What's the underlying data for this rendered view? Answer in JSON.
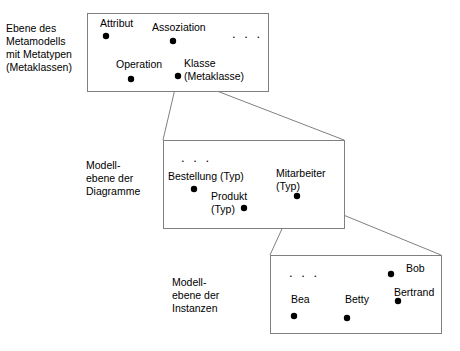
{
  "diagram": {
    "stroke_color": "#808080",
    "dot_color": "#000000",
    "text_color": "#000000",
    "background": "#ffffff",
    "levels": [
      {
        "id": "metamodel",
        "side_label_lines": [
          "Ebene des",
          "Metamodells",
          "mit Metatypen",
          "(Metaklassen)"
        ],
        "box": {
          "x": 87,
          "y": 13,
          "w": 181,
          "h": 78
        },
        "side_label_pos": {
          "x": 6,
          "y": 32
        },
        "ellipsis": {
          "text": ". . .",
          "x": 232,
          "y": 38
        },
        "nodes": [
          {
            "name": "Attribut",
            "lines": [
              "Attribut"
            ],
            "label_x": 100,
            "label_y": 27,
            "dot_x": 106,
            "dot_y": 36
          },
          {
            "name": "Assoziation",
            "lines": [
              "Assoziation"
            ],
            "label_x": 152,
            "label_y": 31,
            "dot_x": 173,
            "dot_y": 41
          },
          {
            "name": "Operation",
            "lines": [
              "Operation"
            ],
            "label_x": 116,
            "label_y": 68,
            "dot_x": 131,
            "dot_y": 79
          },
          {
            "name": "Klasse (Metaklasse)",
            "lines": [
              "Klasse",
              "(Metaklasse)"
            ],
            "label_x": 184,
            "label_y": 67,
            "dot_x": 178,
            "dot_y": 76
          }
        ]
      },
      {
        "id": "diagram-model",
        "side_label_lines": [
          "Modell-",
          "ebene der",
          "Diagramme"
        ],
        "box": {
          "x": 163,
          "y": 140,
          "w": 181,
          "h": 88
        },
        "side_label_pos": {
          "x": 86,
          "y": 169
        },
        "ellipsis": {
          "text": ". . .",
          "x": 181,
          "y": 162
        },
        "nodes": [
          {
            "name": "Bestellung (Typ)",
            "lines": [
              "Bestellung (Typ)"
            ],
            "label_x": 168,
            "label_y": 180,
            "dot_x": 194,
            "dot_y": 189
          },
          {
            "name": "Produkt (Typ)",
            "lines": [
              "Produkt",
              "(Typ)"
            ],
            "label_x": 211,
            "label_y": 200,
            "dot_x": 244,
            "dot_y": 208
          },
          {
            "name": "Mitarbeiter (Typ)",
            "lines": [
              "Mitarbeiter",
              "(Typ)"
            ],
            "label_x": 276,
            "label_y": 177,
            "dot_x": 297,
            "dot_y": 196
          }
        ]
      },
      {
        "id": "instance-model",
        "side_label_lines": [
          "Modell-",
          "ebene der",
          "Instanzen"
        ],
        "box": {
          "x": 270,
          "y": 255,
          "w": 171,
          "h": 78
        },
        "side_label_pos": {
          "x": 172,
          "y": 286
        },
        "ellipsis": {
          "text": ". . .",
          "x": 289,
          "y": 277
        },
        "nodes": [
          {
            "name": "Bob",
            "lines": [
              "Bob"
            ],
            "label_x": 406,
            "label_y": 272,
            "dot_x": 391,
            "dot_y": 274
          },
          {
            "name": "Bertrand",
            "lines": [
              "Bertrand"
            ],
            "label_x": 394,
            "label_y": 296,
            "dot_x": 398,
            "dot_y": 301
          },
          {
            "name": "Bea",
            "lines": [
              "Bea"
            ],
            "label_x": 291,
            "label_y": 303,
            "dot_x": 294,
            "dot_y": 316
          },
          {
            "name": "Betty",
            "lines": [
              "Betty"
            ],
            "label_x": 345,
            "label_y": 303,
            "dot_x": 347,
            "dot_y": 318
          }
        ]
      }
    ],
    "connectors": [
      {
        "name": "klasse-to-diagram-level",
        "from_x": 178,
        "from_y": 76,
        "to_left_x": 163,
        "to_left_y": 140,
        "to_right_x": 344,
        "to_right_y": 140
      },
      {
        "name": "mitarbeiter-to-instance-level",
        "from_x": 297,
        "from_y": 196,
        "to_left_x": 270,
        "to_left_y": 255,
        "to_right_x": 441,
        "to_right_y": 255
      }
    ]
  }
}
